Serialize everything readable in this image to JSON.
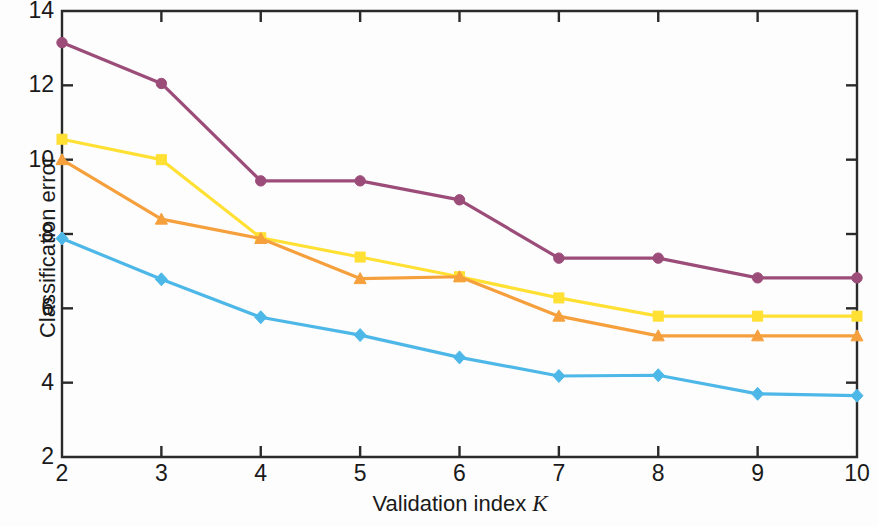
{
  "chart_data": {
    "type": "line",
    "title": "",
    "xlabel": "Validation index  K",
    "xlabel_main": "Validation index",
    "xlabel_italic": "K",
    "ylabel": "Classification error",
    "x": [
      2,
      3,
      4,
      5,
      6,
      7,
      8,
      9,
      10
    ],
    "xlim": [
      2,
      10
    ],
    "ylim": [
      2,
      14
    ],
    "xticks": [
      2,
      3,
      4,
      5,
      6,
      7,
      8,
      9,
      10
    ],
    "yticks": [
      2,
      4,
      6,
      8,
      10,
      12,
      14
    ],
    "xtick_labels": [
      "2",
      "3",
      "4",
      "5",
      "6",
      "7",
      "8",
      "9",
      "10"
    ],
    "ytick_labels": [
      "2",
      "4",
      "6",
      "8",
      "10",
      "12",
      "14"
    ],
    "grid": false,
    "legend": "none",
    "series": [
      {
        "name": "purple",
        "color": "#9C4C78",
        "marker": "circle",
        "values": [
          13.15,
          12.05,
          9.43,
          9.43,
          8.92,
          7.35,
          7.35,
          6.82,
          6.82
        ]
      },
      {
        "name": "yellow",
        "color": "#FFE033",
        "marker": "square",
        "values": [
          10.55,
          10.0,
          7.9,
          7.38,
          6.85,
          6.28,
          5.79,
          5.79,
          5.79
        ]
      },
      {
        "name": "orange",
        "color": "#F5A03C",
        "marker": "triangle",
        "values": [
          10.0,
          8.4,
          7.88,
          6.8,
          6.85,
          5.79,
          5.26,
          5.26,
          5.26
        ]
      },
      {
        "name": "blue",
        "color": "#4DB8E8",
        "marker": "diamond",
        "values": [
          7.88,
          6.78,
          5.76,
          5.28,
          4.68,
          4.18,
          4.2,
          3.7,
          3.65
        ]
      }
    ]
  }
}
